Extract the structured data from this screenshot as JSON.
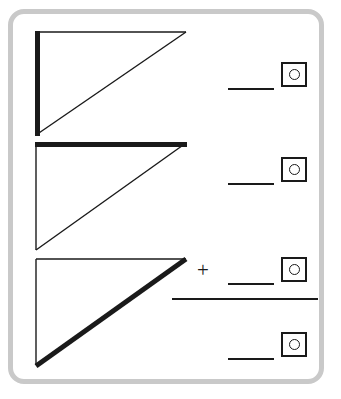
{
  "page": {
    "background_color": "#ffffff",
    "frame_color": "#c9c9c9",
    "ink_color": "#1a1a1a"
  },
  "figure": {
    "type": "three-stacked-right-triangles",
    "triangles": [
      {
        "id": "triangle-1",
        "emphasized_side": "vertical-leg",
        "vertices": [
          [
            36,
            32
          ],
          [
            186,
            32
          ],
          [
            36,
            135
          ]
        ],
        "bold_edge": "left vertical leg",
        "bold_stroke_width": 5,
        "thin_stroke_width": 1.4
      },
      {
        "id": "triangle-2",
        "emphasized_side": "horizontal-leg",
        "vertices": [
          [
            36,
            143
          ],
          [
            186,
            143
          ],
          [
            36,
            250
          ]
        ],
        "bold_edge": "top horizontal leg",
        "bold_stroke_width": 5,
        "thin_stroke_width": 1.4
      },
      {
        "id": "triangle-3",
        "emphasized_side": "hypotenuse",
        "vertices": [
          [
            36,
            259
          ],
          [
            186,
            259
          ],
          [
            36,
            365
          ]
        ],
        "bold_edge": "hypotenuse",
        "bold_stroke_width": 5,
        "thin_stroke_width": 1.4
      }
    ]
  },
  "answer_rows": [
    {
      "id": "row-1",
      "operator": "",
      "blank_line": "",
      "unit_box": "unit-selector",
      "line_x": 228,
      "line_y": 88,
      "line_width": 46,
      "box_x": 281,
      "box_y": 62
    },
    {
      "id": "row-2",
      "operator": "",
      "blank_line": "",
      "unit_box": "unit-selector",
      "line_x": 228,
      "line_y": 183,
      "line_width": 46,
      "box_x": 281,
      "box_y": 157
    },
    {
      "id": "row-3",
      "operator": "+",
      "blank_line": "",
      "unit_box": "unit-selector",
      "line_x": 228,
      "line_y": 283,
      "line_width": 46,
      "box_x": 281,
      "box_y": 257
    },
    {
      "id": "row-4",
      "operator": "",
      "blank_line": "",
      "unit_box": "unit-selector",
      "line_x": 228,
      "line_y": 358,
      "line_width": 46,
      "box_x": 281,
      "box_y": 332
    }
  ],
  "sum_rule": {
    "id": "addition-rule",
    "x": 172,
    "y": 298,
    "width": 146
  },
  "operator_plus": {
    "symbol": "+",
    "x": 195,
    "y": 262
  },
  "icons": {
    "unit_box_circle": "circle-in-square-icon"
  }
}
